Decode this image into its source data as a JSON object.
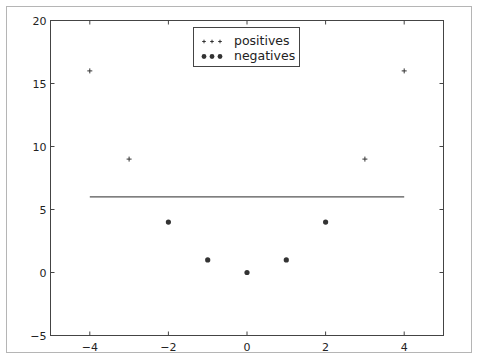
{
  "chart_data": {
    "type": "scatter",
    "title": "",
    "xlabel": "",
    "ylabel": "",
    "xlim": [
      -5,
      5
    ],
    "ylim": [
      -5,
      20
    ],
    "grid": false,
    "legend_position": "upper center",
    "x_ticks": [
      -4,
      -2,
      0,
      2,
      4
    ],
    "x_tick_labels": [
      "−4",
      "−2",
      "0",
      "2",
      "4"
    ],
    "y_ticks": [
      -5,
      0,
      5,
      10,
      15,
      20
    ],
    "y_tick_labels": [
      "−5",
      "0",
      "5",
      "10",
      "15",
      "20"
    ],
    "series": [
      {
        "name": "positives",
        "marker": "+",
        "color": "#333333",
        "points": [
          [
            -4,
            16
          ],
          [
            -3,
            9
          ],
          [
            3,
            9
          ],
          [
            4,
            16
          ]
        ]
      },
      {
        "name": "negatives",
        "marker": "o",
        "color": "#333333",
        "points": [
          [
            -2,
            4
          ],
          [
            -1,
            1
          ],
          [
            0,
            0
          ],
          [
            1,
            1
          ],
          [
            2,
            4
          ]
        ]
      }
    ],
    "lines": [
      {
        "name": "separator",
        "color": "#555555",
        "points": [
          [
            -4,
            6
          ],
          [
            4,
            6
          ]
        ]
      }
    ]
  },
  "legend": {
    "items": [
      {
        "label": "positives",
        "marker": "plus-marker"
      },
      {
        "label": "negatives",
        "marker": "dot-marker"
      }
    ]
  }
}
